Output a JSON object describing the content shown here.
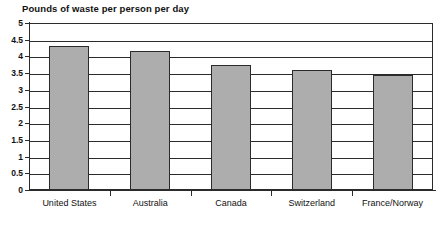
{
  "chart_data": {
    "type": "bar",
    "title": "Pounds of waste per person per day",
    "subtitle": "",
    "xlabel": "",
    "ylabel": "",
    "categories": [
      "United States",
      "Australia",
      "Canada",
      "Switzerland",
      "France/Norway"
    ],
    "values": [
      4.3,
      4.15,
      3.75,
      3.6,
      3.45
    ],
    "ylim": [
      0,
      5
    ],
    "ytick_labels": [
      "5",
      "4.5",
      "4",
      "3.5",
      "3",
      "2.5",
      "2",
      "1.5",
      "1",
      "0.5",
      "0"
    ],
    "ytick_values": [
      5,
      4.5,
      4,
      3.5,
      3,
      2.5,
      2,
      1.5,
      1,
      0.5,
      0
    ],
    "grid": true,
    "legend": "none",
    "series": [
      {
        "name": "Pounds of waste per person per day",
        "values": [
          4.3,
          4.15,
          3.75,
          3.6,
          3.45
        ]
      }
    ],
    "colors": {
      "bar_fill": "#adadad",
      "bar_border": "#2b2b2b",
      "grid": "#2b2b2b",
      "axis": "#2b2b2b",
      "text": "#111111",
      "background": "#ffffff"
    }
  }
}
